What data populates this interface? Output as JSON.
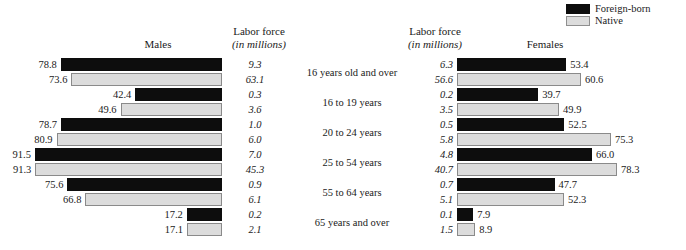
{
  "legend": {
    "items": [
      {
        "label": "Foreign-born",
        "color": "#0d0d0d",
        "icon": "filled-square-black"
      },
      {
        "label": "Native",
        "color": "#dcdcdc",
        "icon": "filled-square-gray"
      }
    ]
  },
  "headers": {
    "males": "Males",
    "females": "Females",
    "labor_force_line1": "Labor force",
    "labor_force_line2": "(in millions)"
  },
  "chart_data": {
    "type": "bar",
    "title": "",
    "subtitle": "",
    "orientation": "horizontal-bidirectional",
    "xlabel": "Labor force participation rate (percent)",
    "ylabel": "Age group",
    "grid": false,
    "legend_position": "top-right",
    "categories": [
      "16 years old and over",
      "16 to 19 years",
      "20 to 24 years",
      "25 to 54 years",
      "55 to 64 years",
      "65 years and over"
    ],
    "panels": [
      {
        "name": "Males",
        "direction": "right-to-left",
        "series": [
          {
            "name": "Foreign-born",
            "participation_rate": [
              78.8,
              42.4,
              78.7,
              91.5,
              75.6,
              17.2
            ],
            "labor_force_millions": [
              9.3,
              0.3,
              1.0,
              7.0,
              0.9,
              0.2
            ]
          },
          {
            "name": "Native",
            "participation_rate": [
              73.6,
              49.6,
              80.9,
              91.3,
              66.8,
              17.1
            ],
            "labor_force_millions": [
              63.1,
              3.6,
              6.0,
              45.3,
              6.1,
              2.1
            ]
          }
        ]
      },
      {
        "name": "Females",
        "direction": "left-to-right",
        "series": [
          {
            "name": "Foreign-born",
            "participation_rate": [
              53.4,
              39.7,
              52.5,
              66.0,
              47.7,
              7.9
            ],
            "labor_force_millions": [
              6.3,
              0.2,
              0.5,
              4.8,
              0.7,
              0.1
            ]
          },
          {
            "name": "Native",
            "participation_rate": [
              60.6,
              49.9,
              75.3,
              78.3,
              52.3,
              8.9
            ],
            "labor_force_millions": [
              56.6,
              3.5,
              5.8,
              40.7,
              5.1,
              1.5
            ]
          }
        ]
      }
    ],
    "xlim": [
      0,
      100
    ],
    "value_label_format": "one-decimal",
    "labor_force_label_format": "one-decimal-italic"
  }
}
